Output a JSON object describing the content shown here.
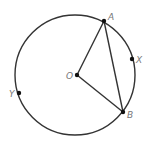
{
  "diagram": {
    "type": "circle-geometry",
    "circle": {
      "cx": 75,
      "cy": 75,
      "r": 60,
      "stroke": "#333333"
    },
    "points": [
      {
        "id": "A",
        "label": "A",
        "x": 104,
        "y": 21,
        "lx": 108,
        "ly": 20
      },
      {
        "id": "X",
        "label": "X",
        "x": 132,
        "y": 59,
        "lx": 136,
        "ly": 63
      },
      {
        "id": "O",
        "label": "O",
        "x": 77,
        "y": 75,
        "lx": 66,
        "ly": 79
      },
      {
        "id": "Y",
        "label": "Y",
        "x": 19,
        "y": 93,
        "lx": 9,
        "ly": 97
      },
      {
        "id": "B",
        "label": "B",
        "x": 123,
        "y": 112,
        "lx": 127,
        "ly": 118
      }
    ],
    "segments": [
      {
        "from": "O",
        "to": "A"
      },
      {
        "from": "O",
        "to": "B"
      },
      {
        "from": "A",
        "to": "B"
      }
    ],
    "colors": {
      "line": "#333333",
      "point": "#111111",
      "label": "#777777"
    }
  }
}
